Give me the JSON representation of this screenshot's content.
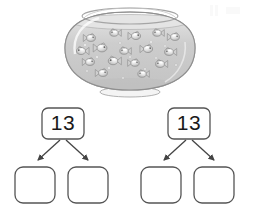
{
  "page": {
    "background_color": "#ffffff"
  },
  "illustration": {
    "name": "fishbowl",
    "description": "Glass fishbowl filled with water containing small fish",
    "item_count": 16,
    "colors": {
      "glass_outline": "#9a9a9a",
      "glass_fill": "#f2f2f2",
      "water_fill": "#c9c9c9",
      "water_top": "#dcdcdc",
      "fish_body": "#d6d6d6",
      "fish_outline": "#8c8c8c",
      "highlight": "#ffffff"
    },
    "fish": [
      {
        "cx": 34,
        "cy": 36,
        "r": 4.4,
        "flip": false
      },
      {
        "cx": 57,
        "cy": 31,
        "r": 4.2,
        "flip": true
      },
      {
        "cx": 79,
        "cy": 34,
        "r": 4.6,
        "flip": false
      },
      {
        "cx": 100,
        "cy": 31,
        "r": 4.2,
        "flip": true
      },
      {
        "cx": 118,
        "cy": 35,
        "r": 4.4,
        "flip": false
      },
      {
        "cx": 24,
        "cy": 49,
        "r": 4.6,
        "flip": true
      },
      {
        "cx": 45,
        "cy": 46,
        "r": 5.0,
        "flip": false
      },
      {
        "cx": 67,
        "cy": 49,
        "r": 4.2,
        "flip": true
      },
      {
        "cx": 91,
        "cy": 47,
        "r": 4.6,
        "flip": false
      },
      {
        "cx": 112,
        "cy": 50,
        "r": 4.4,
        "flip": true
      },
      {
        "cx": 33,
        "cy": 60,
        "r": 4.4,
        "flip": false
      },
      {
        "cx": 56,
        "cy": 59,
        "r": 4.8,
        "flip": true
      },
      {
        "cx": 78,
        "cy": 61,
        "r": 4.2,
        "flip": false
      },
      {
        "cx": 103,
        "cy": 62,
        "r": 4.4,
        "flip": true
      },
      {
        "cx": 46,
        "cy": 71,
        "r": 4.4,
        "flip": false
      },
      {
        "cx": 85,
        "cy": 72,
        "r": 4.2,
        "flip": true
      }
    ],
    "bubbles": [
      {
        "cx": 28,
        "cy": 43,
        "r": 1.3
      },
      {
        "cx": 63,
        "cy": 41,
        "r": 1.1
      },
      {
        "cx": 94,
        "cy": 40,
        "r": 1.2
      },
      {
        "cx": 108,
        "cy": 44,
        "r": 1.0
      },
      {
        "cx": 40,
        "cy": 55,
        "r": 1.2
      },
      {
        "cx": 73,
        "cy": 55,
        "r": 1.1
      },
      {
        "cx": 99,
        "cy": 56,
        "r": 1.0
      },
      {
        "cx": 52,
        "cy": 66,
        "r": 1.2
      },
      {
        "cx": 88,
        "cy": 67,
        "r": 1.1
      },
      {
        "cx": 66,
        "cy": 76,
        "r": 1.0
      },
      {
        "cx": 30,
        "cy": 69,
        "r": 1.0
      },
      {
        "cx": 119,
        "cy": 63,
        "r": 1.1
      }
    ]
  },
  "number_bonds": [
    {
      "id": "bond-left",
      "whole": {
        "label": "13",
        "filled": true
      },
      "parts": [
        {
          "label": "",
          "filled": false
        },
        {
          "label": "",
          "filled": false
        }
      ],
      "arrows": 2
    },
    {
      "id": "bond-right",
      "whole": {
        "label": "13",
        "filled": true
      },
      "parts": [
        {
          "label": "",
          "filled": false
        },
        {
          "label": "",
          "filled": false
        }
      ],
      "arrows": 2
    }
  ],
  "style": {
    "box_stroke": "#555555",
    "box_fill": "#ffffff",
    "arrow_stroke": "#444444",
    "text_color": "#1a1a1a"
  }
}
